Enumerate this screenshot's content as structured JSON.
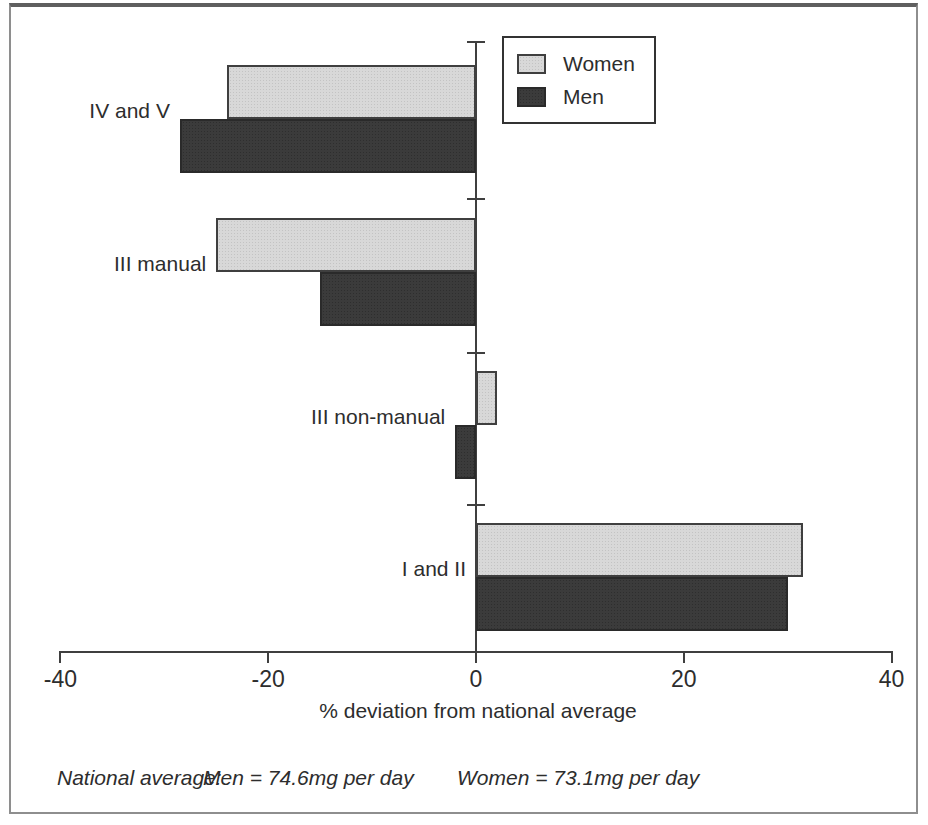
{
  "chart_data": {
    "type": "bar",
    "orientation": "horizontal",
    "categories": [
      "IV and V",
      "III manual",
      "III non-manual",
      "I and II"
    ],
    "series": [
      {
        "name": "Women",
        "values": [
          -24,
          -25,
          2,
          31.5
        ],
        "color": "#d8d8d8"
      },
      {
        "name": "Men",
        "values": [
          -28.5,
          -15,
          -2,
          30
        ],
        "color": "#3b3b3b"
      }
    ],
    "xlabel": "% deviation from national average",
    "x_ticks": [
      -40,
      -20,
      0,
      20,
      40
    ],
    "xlim": [
      -40,
      40
    ],
    "grid": false,
    "legend_position": "top-right"
  },
  "footer": {
    "prefix": "National average:",
    "men": "Men = 74.6mg per day",
    "women": "Women = 73.1mg per day"
  },
  "colors": {
    "women_bar": "#d8d8d8",
    "men_bar": "#3b3b3b",
    "axis": "#3f3f3f",
    "text": "#2d2d2d"
  }
}
